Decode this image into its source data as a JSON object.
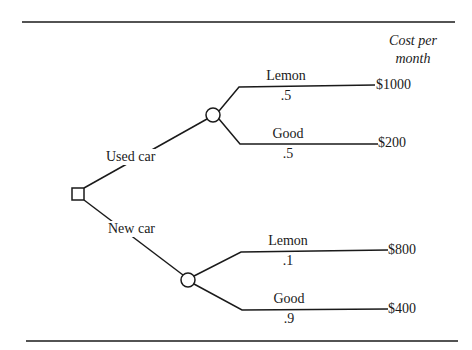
{
  "diagram": {
    "type": "decision-tree",
    "header": {
      "line1": "Cost per",
      "line2": "month"
    },
    "decision_node": {
      "shape": "square",
      "options": [
        {
          "label": "Used car",
          "chance_node": {
            "outcomes": [
              {
                "label": "Lemon",
                "probability": ".5",
                "cost": "$1000"
              },
              {
                "label": "Good",
                "probability": ".5",
                "cost": "$200"
              }
            ]
          }
        },
        {
          "label": "New car",
          "chance_node": {
            "outcomes": [
              {
                "label": "Lemon",
                "probability": ".1",
                "cost": "$800"
              },
              {
                "label": "Good",
                "probability": ".9",
                "cost": "$400"
              }
            ]
          }
        }
      ]
    },
    "colors": {
      "line": "#1a1a1a",
      "background": "#ffffff"
    }
  }
}
